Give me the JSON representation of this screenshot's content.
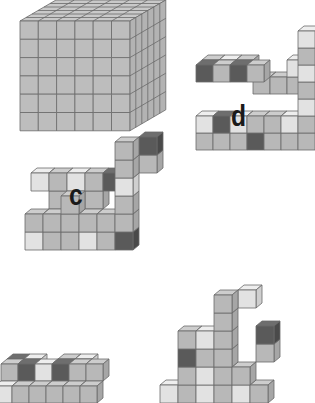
{
  "figure": {
    "colors": {
      "light": {
        "front": "#e2e2e2",
        "top": "#eeeeee",
        "side": "#cfcfcf"
      },
      "mid": {
        "front": "#b8b8b8",
        "top": "#cdcdcd",
        "side": "#a6a6a6"
      },
      "dark": {
        "front": "#5a5a5a",
        "top": "#6e6e6e",
        "side": "#4a4a4a"
      },
      "edge": "#6a6a6a"
    },
    "labels": [
      {
        "id": "c",
        "text": "c",
        "x": 69,
        "y": 180
      },
      {
        "id": "d",
        "text": "d",
        "x": 231,
        "y": 101
      }
    ],
    "big_cube": {
      "name": "full-6x6x6-cube",
      "x": 20,
      "y": 21,
      "n": 6,
      "size": 18.3,
      "depth": 6,
      "dx": 6.0,
      "dy": -3.5
    },
    "structures": [
      {
        "name": "structure-d",
        "ox": 196,
        "oy": 150,
        "s": 17,
        "ddx": 6,
        "ddy": -5,
        "cubes": [
          [
            0,
            0,
            0,
            "mid"
          ],
          [
            1,
            0,
            0,
            "mid"
          ],
          [
            2,
            0,
            0,
            "mid"
          ],
          [
            3,
            0,
            0,
            "dark"
          ],
          [
            4,
            0,
            0,
            "mid"
          ],
          [
            5,
            0,
            0,
            "mid"
          ],
          [
            6,
            0,
            0,
            "mid"
          ],
          [
            0,
            1,
            0,
            "light"
          ],
          [
            1,
            1,
            0,
            "dark"
          ],
          [
            2,
            1,
            0,
            "light"
          ],
          [
            3,
            1,
            0,
            "mid"
          ],
          [
            4,
            1,
            0,
            "mid"
          ],
          [
            5,
            1,
            0,
            "light"
          ],
          [
            6,
            1,
            0,
            "mid"
          ],
          [
            6,
            2,
            0,
            "light"
          ],
          [
            6,
            3,
            0,
            "mid"
          ],
          [
            6,
            4,
            0,
            "light"
          ],
          [
            6,
            5,
            0,
            "mid"
          ],
          [
            6,
            6,
            0,
            "light"
          ],
          [
            5,
            3,
            1,
            "mid"
          ],
          [
            5,
            4,
            1,
            "light"
          ],
          [
            0,
            4,
            0,
            "dark"
          ],
          [
            1,
            4,
            0,
            "mid"
          ],
          [
            2,
            4,
            0,
            "dark"
          ],
          [
            3,
            4,
            0,
            "mid"
          ],
          [
            0,
            4,
            1,
            "mid"
          ],
          [
            1,
            4,
            1,
            "light"
          ],
          [
            2,
            4,
            1,
            "mid"
          ],
          [
            3,
            3,
            1,
            "mid"
          ],
          [
            4,
            3,
            1,
            "mid"
          ]
        ]
      },
      {
        "name": "structure-c",
        "ox": 25,
        "oy": 250,
        "s": 18,
        "ddx": 6,
        "ddy": -5,
        "cubes": [
          [
            0,
            0,
            0,
            "light"
          ],
          [
            1,
            0,
            0,
            "mid"
          ],
          [
            2,
            0,
            0,
            "mid"
          ],
          [
            3,
            0,
            0,
            "light"
          ],
          [
            4,
            0,
            0,
            "mid"
          ],
          [
            5,
            0,
            0,
            "dark"
          ],
          [
            0,
            1,
            0,
            "mid"
          ],
          [
            1,
            1,
            0,
            "mid"
          ],
          [
            2,
            1,
            0,
            "mid"
          ],
          [
            3,
            1,
            0,
            "mid"
          ],
          [
            4,
            1,
            0,
            "mid"
          ],
          [
            5,
            1,
            0,
            "mid"
          ],
          [
            2,
            2,
            0,
            "mid"
          ],
          [
            5,
            2,
            0,
            "mid"
          ],
          [
            5,
            3,
            0,
            "light"
          ],
          [
            5,
            4,
            0,
            "mid"
          ],
          [
            5,
            5,
            0,
            "mid"
          ],
          [
            6,
            5,
            1,
            "dark"
          ],
          [
            6,
            4,
            1,
            "mid"
          ],
          [
            0,
            3,
            1,
            "light"
          ],
          [
            1,
            3,
            1,
            "mid"
          ],
          [
            2,
            3,
            1,
            "light"
          ],
          [
            3,
            3,
            1,
            "mid"
          ],
          [
            4,
            3,
            1,
            "dark"
          ],
          [
            1,
            2,
            1,
            "mid"
          ],
          [
            3,
            2,
            1,
            "mid"
          ]
        ]
      },
      {
        "name": "structure-bottom-left",
        "ox": -5,
        "oy": 403,
        "s": 17,
        "ddx": 6,
        "ddy": -5,
        "cubes": [
          [
            0,
            0,
            0,
            "light"
          ],
          [
            1,
            0,
            0,
            "mid"
          ],
          [
            2,
            0,
            0,
            "mid"
          ],
          [
            3,
            0,
            0,
            "mid"
          ],
          [
            4,
            0,
            0,
            "mid"
          ],
          [
            5,
            0,
            0,
            "mid"
          ],
          [
            0,
            1,
            1,
            "mid"
          ],
          [
            1,
            1,
            1,
            "dark"
          ],
          [
            2,
            1,
            1,
            "light"
          ],
          [
            3,
            1,
            1,
            "dark"
          ],
          [
            4,
            1,
            1,
            "mid"
          ],
          [
            5,
            1,
            1,
            "mid"
          ],
          [
            0,
            1,
            2,
            "dark"
          ],
          [
            1,
            1,
            2,
            "light"
          ],
          [
            3,
            1,
            2,
            "mid"
          ],
          [
            4,
            1,
            2,
            "light"
          ]
        ]
      },
      {
        "name": "structure-bottom-right",
        "ox": 160,
        "oy": 403,
        "s": 18,
        "ddx": 6,
        "ddy": -5,
        "cubes": [
          [
            0,
            0,
            0,
            "light"
          ],
          [
            1,
            0,
            0,
            "mid"
          ],
          [
            2,
            0,
            0,
            "light"
          ],
          [
            3,
            0,
            0,
            "mid"
          ],
          [
            4,
            0,
            0,
            "light"
          ],
          [
            5,
            0,
            0,
            "mid"
          ],
          [
            1,
            1,
            0,
            "mid"
          ],
          [
            2,
            1,
            0,
            "light"
          ],
          [
            3,
            1,
            0,
            "mid"
          ],
          [
            4,
            1,
            0,
            "mid"
          ],
          [
            1,
            2,
            0,
            "dark"
          ],
          [
            2,
            2,
            0,
            "mid"
          ],
          [
            3,
            2,
            0,
            "mid"
          ],
          [
            1,
            3,
            0,
            "mid"
          ],
          [
            2,
            3,
            0,
            "light"
          ],
          [
            3,
            3,
            0,
            "mid"
          ],
          [
            3,
            4,
            0,
            "mid"
          ],
          [
            3,
            5,
            0,
            "mid"
          ],
          [
            4,
            5,
            1,
            "light"
          ],
          [
            5,
            3,
            1,
            "dark"
          ],
          [
            5,
            2,
            1,
            "mid"
          ]
        ]
      }
    ]
  }
}
